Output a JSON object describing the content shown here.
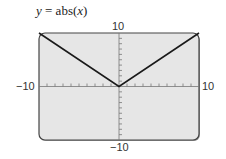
{
  "chart_data": {
    "type": "line",
    "title": "y = abs(x)",
    "xlabel": "",
    "ylabel": "",
    "xlim": [
      -10,
      10
    ],
    "ylim": [
      -10,
      10
    ],
    "grid": false,
    "axis_tick_labels": {
      "x_min": "-10",
      "x_max": "10",
      "y_min": "-10",
      "y_max": "10"
    },
    "tick_spacing": 1,
    "series": [
      {
        "name": "abs(x)",
        "x": [
          -10,
          0,
          10
        ],
        "y": [
          10,
          0,
          10
        ]
      }
    ],
    "colors": {
      "background": "#e6e6e6",
      "line": "#1a1a1a",
      "frame": "#444444"
    }
  },
  "labels": {
    "title_lhs": "y",
    "title_eq": " = abs(",
    "title_var": "x",
    "title_close": ")",
    "xmin": "−10",
    "xmax": "10",
    "ymin": "−10",
    "ymax": "10"
  }
}
